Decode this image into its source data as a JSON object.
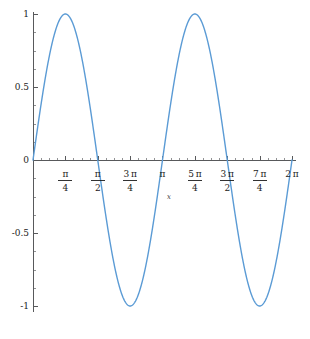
{
  "chart_data": {
    "type": "line",
    "title": "",
    "subtitle": "",
    "xlabel": "x",
    "ylabel": "",
    "function": "sin(2x)",
    "xlim": [
      0,
      6.283185307179586
    ],
    "ylim": [
      -1,
      1
    ],
    "grid": false,
    "legend": null,
    "series": [
      {
        "name": "sin(2x)",
        "color": "#5B9BD5",
        "x": [
          0,
          0.19634954,
          0.39269908,
          0.58904862,
          0.78539816,
          0.9817477,
          1.17809725,
          1.37444679,
          1.57079633,
          1.76714587,
          1.96349541,
          2.15984495,
          2.35619449,
          2.55254403,
          2.74889357,
          2.94524311,
          3.14159265,
          3.33794219,
          3.53429174,
          3.73064128,
          3.92699082,
          4.12334036,
          4.3196899,
          4.51603944,
          4.71238898,
          4.90873852,
          5.10508806,
          5.3014376,
          5.49778714,
          5.69413668,
          5.89048623,
          6.08683577,
          6.28318531
        ],
        "y": [
          0,
          0.38268343,
          0.70710678,
          0.92387953,
          1,
          0.92387953,
          0.70710678,
          0.38268343,
          0,
          -0.38268343,
          -0.70710678,
          -0.92387953,
          -1,
          -0.92387953,
          -0.70710678,
          -0.38268343,
          0,
          0.38268343,
          0.70710678,
          0.92387953,
          1,
          0.92387953,
          0.70710678,
          0.38268343,
          0,
          -0.38268343,
          -0.70710678,
          -0.92387953,
          -1,
          -0.92387953,
          -0.70710678,
          -0.38268343,
          0
        ]
      }
    ],
    "x_ticks": [
      {
        "value": 0.78539816,
        "numerator": "π",
        "denominator": "4",
        "label": "π/4"
      },
      {
        "value": 1.57079633,
        "numerator": "π",
        "denominator": "2",
        "label": "π/2"
      },
      {
        "value": 2.35619449,
        "numerator": "3 π",
        "denominator": "4",
        "label": "3π/4"
      },
      {
        "value": 3.14159265,
        "numerator": "π",
        "denominator": "",
        "label": "π"
      },
      {
        "value": 3.92699082,
        "numerator": "5 π",
        "denominator": "4",
        "label": "5π/4"
      },
      {
        "value": 4.71238898,
        "numerator": "3 π",
        "denominator": "2",
        "label": "3π/2"
      },
      {
        "value": 5.49778714,
        "numerator": "7 π",
        "denominator": "4",
        "label": "7π/4"
      },
      {
        "value": 6.28318531,
        "numerator": "2 π",
        "denominator": "",
        "label": "2π"
      }
    ],
    "y_ticks": [
      {
        "value": 1,
        "label": "1"
      },
      {
        "value": 0.5,
        "label": "0.5"
      },
      {
        "value": 0,
        "label": "0"
      },
      {
        "value": -0.5,
        "label": "-0.5"
      },
      {
        "value": -1,
        "label": "-1"
      }
    ],
    "x_minor_count": 4,
    "y_minor_count": 4,
    "annotations": [
      {
        "text": "x",
        "x": 3.25,
        "y": -0.27,
        "style": "italic"
      }
    ],
    "colors": {
      "curve": "#5B9BD5",
      "axis": "#58595b",
      "text": "#1c1c1c",
      "background": "#ffffff"
    }
  }
}
